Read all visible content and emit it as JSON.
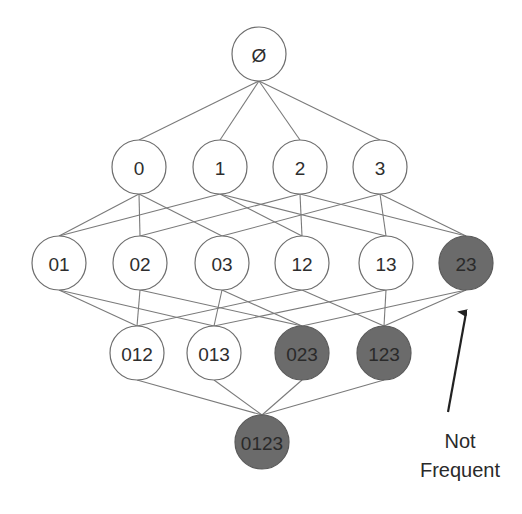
{
  "diagram": {
    "colors": {
      "frequent_fill": "#ffffff",
      "infrequent_fill": "#6b6b6b",
      "edge": "#7a7a7a",
      "text": "#2e2e2e"
    },
    "node_radius": 27,
    "nodes": [
      {
        "id": "empty",
        "label": "Ø",
        "x": 259,
        "y": 54,
        "status": "frequent"
      },
      {
        "id": "0",
        "label": "0",
        "x": 139,
        "y": 167,
        "status": "frequent"
      },
      {
        "id": "1",
        "label": "1",
        "x": 220,
        "y": 167,
        "status": "frequent"
      },
      {
        "id": "2",
        "label": "2",
        "x": 300,
        "y": 167,
        "status": "frequent"
      },
      {
        "id": "3",
        "label": "3",
        "x": 380,
        "y": 167,
        "status": "frequent"
      },
      {
        "id": "01",
        "label": "01",
        "x": 59,
        "y": 263,
        "status": "frequent"
      },
      {
        "id": "02",
        "label": "02",
        "x": 140,
        "y": 263,
        "status": "frequent"
      },
      {
        "id": "03",
        "label": "03",
        "x": 222,
        "y": 263,
        "status": "frequent"
      },
      {
        "id": "12",
        "label": "12",
        "x": 302,
        "y": 263,
        "status": "frequent"
      },
      {
        "id": "13",
        "label": "13",
        "x": 386,
        "y": 263,
        "status": "frequent"
      },
      {
        "id": "23",
        "label": "23",
        "x": 466,
        "y": 263,
        "status": "infrequent"
      },
      {
        "id": "012",
        "label": "012",
        "x": 137,
        "y": 353,
        "status": "frequent"
      },
      {
        "id": "013",
        "label": "013",
        "x": 214,
        "y": 353,
        "status": "frequent"
      },
      {
        "id": "023",
        "label": "023",
        "x": 302,
        "y": 353,
        "status": "infrequent"
      },
      {
        "id": "123",
        "label": "123",
        "x": 384,
        "y": 353,
        "status": "infrequent"
      },
      {
        "id": "0123",
        "label": "0123",
        "x": 262,
        "y": 442,
        "status": "infrequent"
      }
    ],
    "edges": [
      [
        "empty",
        "0"
      ],
      [
        "empty",
        "1"
      ],
      [
        "empty",
        "2"
      ],
      [
        "empty",
        "3"
      ],
      [
        "0",
        "01"
      ],
      [
        "0",
        "02"
      ],
      [
        "0",
        "03"
      ],
      [
        "1",
        "01"
      ],
      [
        "1",
        "12"
      ],
      [
        "1",
        "13"
      ],
      [
        "2",
        "02"
      ],
      [
        "2",
        "12"
      ],
      [
        "2",
        "23"
      ],
      [
        "3",
        "03"
      ],
      [
        "3",
        "13"
      ],
      [
        "3",
        "23"
      ],
      [
        "01",
        "012"
      ],
      [
        "01",
        "013"
      ],
      [
        "02",
        "012"
      ],
      [
        "02",
        "023"
      ],
      [
        "03",
        "013"
      ],
      [
        "03",
        "023"
      ],
      [
        "12",
        "012"
      ],
      [
        "12",
        "123"
      ],
      [
        "13",
        "013"
      ],
      [
        "13",
        "123"
      ],
      [
        "23",
        "023"
      ],
      [
        "23",
        "123"
      ],
      [
        "012",
        "0123"
      ],
      [
        "013",
        "0123"
      ],
      [
        "023",
        "0123"
      ],
      [
        "123",
        "0123"
      ]
    ],
    "annotation": {
      "line1": "Not",
      "line2": "Frequent",
      "text_x": 460,
      "line1_y": 448,
      "line2_y": 477,
      "arrow": {
        "x1": 448,
        "y1": 412,
        "x2": 466,
        "y2": 313
      },
      "target": "23"
    }
  }
}
